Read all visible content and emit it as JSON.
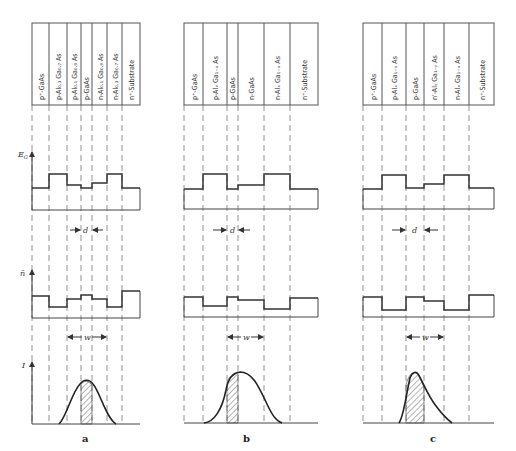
{
  "figure": {
    "axes_labels": {
      "energy": "E_G",
      "index": "n̄",
      "intensity": "I"
    },
    "markers": {
      "d": "d",
      "w": "w"
    },
    "panels": [
      {
        "caption": "a",
        "layers": [
          "p⁺-GaAs",
          "p-Al₀.₃ Ga₀.₇ As",
          "p-Al₀.₁ Ga₀.₉ As",
          "p-GaAs",
          "n-Al₀.₁ Ga₀.₉ As",
          "n-Al₀.₃ Ga₀.₇ As",
          "n⁺-Substrate"
        ]
      },
      {
        "caption": "b",
        "layers": [
          "p⁺-GaAs",
          "p-Alₓ Ga₁₋ₓ As",
          "p-GaAs",
          "n-GaAs",
          "n-Alₓ Ga₁₋ₓ As",
          "n⁺-Substrate"
        ]
      },
      {
        "caption": "c",
        "layers": [
          "p⁺-GaAs",
          "p-Alₓ Ga₁₋ₓ As",
          "p-GaAs",
          "n'-Alᵧ Ga₁₋ᵧ As",
          "n-Alₓ Ga₁₋ₓ As",
          "n⁺-Substrate"
        ]
      }
    ]
  }
}
